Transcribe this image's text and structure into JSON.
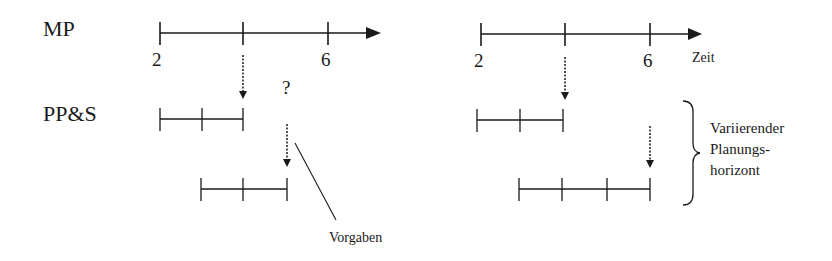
{
  "diagram": {
    "row_labels": {
      "master_planning": "MP",
      "production_planning": "PP&S"
    },
    "question_mark": "?",
    "annotation_left": "Vorgaben",
    "left_axis": {
      "ticks": [
        "2",
        "6"
      ]
    },
    "right_axis": {
      "ticks": [
        "2",
        "6"
      ],
      "axis_label": "Zeit"
    },
    "brace_label": {
      "line1": "Variierender",
      "line2": "Planungs-",
      "line3": "horizont"
    },
    "colors": {
      "line": "#1a1a1a",
      "background": "#ffffff"
    }
  }
}
